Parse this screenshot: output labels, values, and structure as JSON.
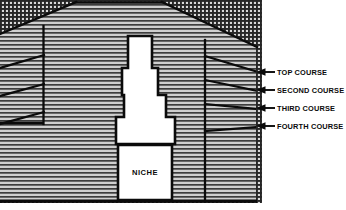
{
  "figure": {
    "kind": "architectural-section-drawing",
    "niche": {
      "label": "NICHE"
    },
    "callouts": [
      {
        "id": "top-course",
        "label": "TOP COURSE",
        "arrow_x": 258,
        "text_x": 270,
        "y": 72
      },
      {
        "id": "second-course",
        "label": "SECOND COURSE",
        "arrow_x": 258,
        "text_x": 270,
        "y": 90
      },
      {
        "id": "third-course",
        "label": "THIRD COURSE",
        "arrow_x": 258,
        "text_x": 270,
        "y": 108
      },
      {
        "id": "fourth-course",
        "label": "FOURTH COURSE",
        "arrow_x": 258,
        "text_x": 270,
        "y": 126
      }
    ],
    "colors": {
      "ink": "#0b0b0b",
      "paper": "#ffffff",
      "hatch_light": "#c9c9c9",
      "hatch_dark": "#4a4a4a",
      "stipple": "#2f2f2f"
    }
  }
}
